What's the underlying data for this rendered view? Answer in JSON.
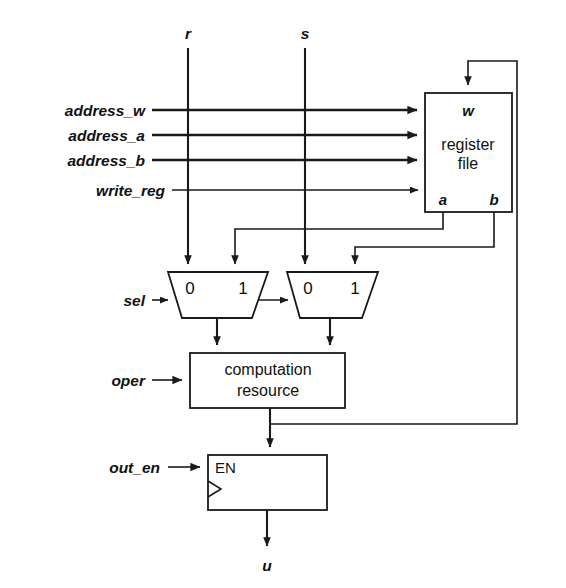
{
  "diagram": {
    "colors": {
      "line": "#1a1a1a",
      "text": "#111111",
      "background": "#ffffff"
    },
    "top_inputs": [
      {
        "name": "r",
        "label": "r",
        "x": 188
      },
      {
        "name": "s",
        "label": "s",
        "x": 305
      }
    ],
    "left_inputs": [
      {
        "name": "address_w",
        "label": "address_w"
      },
      {
        "name": "address_a",
        "label": "address_a"
      },
      {
        "name": "address_b",
        "label": "address_b"
      },
      {
        "name": "write_reg",
        "label": "write_reg"
      },
      {
        "name": "sel",
        "label": "sel"
      },
      {
        "name": "oper",
        "label": "oper"
      },
      {
        "name": "out_en",
        "label": "out_en"
      }
    ],
    "register_file": {
      "label_line1": "register",
      "label_line2": "file",
      "port_w": "w",
      "port_a": "a",
      "port_b": "b"
    },
    "mux_left": {
      "input0": "0",
      "input1": "1"
    },
    "mux_right": {
      "input0": "0",
      "input1": "1"
    },
    "computation": {
      "label_line1": "computation",
      "label_line2": "resource"
    },
    "output_register": {
      "enable_label": "EN"
    },
    "output": {
      "label": "u"
    }
  }
}
